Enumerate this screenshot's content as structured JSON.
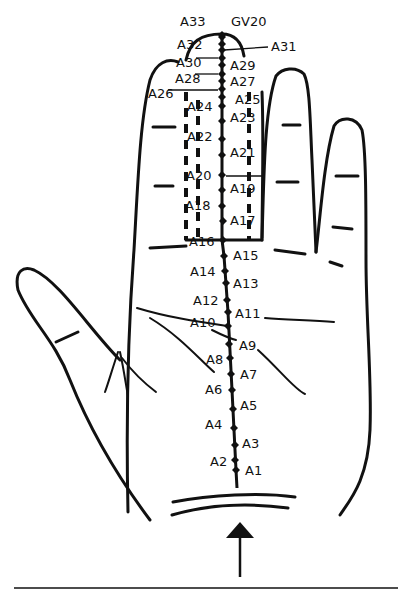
{
  "figure": {
    "arrow_direction": "up",
    "points": [
      {
        "id": "A1",
        "label": "A1",
        "x": 236,
        "y": 470,
        "side": "right"
      },
      {
        "id": "A2",
        "label": "A2",
        "x": 235,
        "y": 460,
        "side": "left"
      },
      {
        "id": "A3",
        "label": "A3",
        "x": 235,
        "y": 445,
        "side": "right"
      },
      {
        "id": "A4",
        "label": "A4",
        "x": 234,
        "y": 428,
        "side": "left"
      },
      {
        "id": "A5",
        "label": "A5",
        "x": 233,
        "y": 409,
        "side": "right"
      },
      {
        "id": "A6",
        "label": "A6",
        "x": 232,
        "y": 390,
        "side": "left"
      },
      {
        "id": "A7",
        "label": "A7",
        "x": 231,
        "y": 374,
        "side": "right"
      },
      {
        "id": "A8",
        "label": "A8",
        "x": 230,
        "y": 358,
        "side": "left"
      },
      {
        "id": "A9",
        "label": "A9",
        "x": 229,
        "y": 344,
        "side": "right"
      },
      {
        "id": "A10",
        "label": "A10",
        "x": 228,
        "y": 326,
        "side": "left"
      },
      {
        "id": "A11",
        "label": "A11",
        "x": 228,
        "y": 312,
        "side": "right"
      },
      {
        "id": "A12",
        "label": "A12",
        "x": 227,
        "y": 300,
        "side": "left"
      },
      {
        "id": "A13",
        "label": "A13",
        "x": 226,
        "y": 283,
        "side": "right"
      },
      {
        "id": "A14",
        "label": "A14",
        "x": 225,
        "y": 271,
        "side": "left"
      },
      {
        "id": "A15",
        "label": "A15",
        "x": 224,
        "y": 256,
        "side": "right"
      },
      {
        "id": "A16",
        "label": "A16",
        "x": 223,
        "y": 240,
        "side": "left"
      },
      {
        "id": "A17",
        "label": "A17",
        "x": 223,
        "y": 221,
        "side": "right"
      },
      {
        "id": "A18",
        "label": "A18",
        "x": 222,
        "y": 206,
        "side": "left"
      },
      {
        "id": "A19",
        "label": "A19",
        "x": 222,
        "y": 190,
        "side": "right"
      },
      {
        "id": "A20",
        "label": "A20",
        "x": 222,
        "y": 175,
        "side": "left"
      },
      {
        "id": "A21",
        "label": "A21",
        "x": 222,
        "y": 155,
        "side": "right"
      },
      {
        "id": "A22",
        "label": "A22",
        "x": 222,
        "y": 139,
        "side": "left"
      },
      {
        "id": "A23",
        "label": "A23",
        "x": 222,
        "y": 121,
        "side": "right"
      },
      {
        "id": "A24",
        "label": "A24",
        "x": 222,
        "y": 106,
        "side": "left"
      },
      {
        "id": "A25",
        "label": "A25",
        "x": 222,
        "y": 97,
        "side": "right"
      },
      {
        "id": "A26",
        "label": "A26",
        "x": 222,
        "y": 89,
        "side": "left"
      },
      {
        "id": "A27",
        "label": "A27",
        "x": 222,
        "y": 81,
        "side": "right"
      },
      {
        "id": "A28",
        "label": "A28",
        "x": 222,
        "y": 74,
        "side": "left"
      },
      {
        "id": "A29",
        "label": "A29",
        "x": 222,
        "y": 65,
        "side": "right"
      },
      {
        "id": "A30",
        "label": "A30",
        "x": 222,
        "y": 58,
        "side": "left"
      },
      {
        "id": "A31",
        "label": "A31",
        "x": 222,
        "y": 50,
        "side": "right"
      },
      {
        "id": "A32",
        "label": "A32",
        "x": 222,
        "y": 44,
        "side": "left"
      },
      {
        "id": "A33",
        "label": "A33",
        "x": 222,
        "y": 37,
        "side": "top"
      },
      {
        "id": "GV20",
        "label": "GV20",
        "x": 222,
        "y": 35,
        "side": "top"
      }
    ],
    "labels": [
      {
        "text": "A33",
        "x": 180,
        "y": 26
      },
      {
        "text": "GV20",
        "x": 231,
        "y": 26
      },
      {
        "text": "A32",
        "x": 177,
        "y": 49
      },
      {
        "text": "A31",
        "x": 271,
        "y": 51
      },
      {
        "text": "A30",
        "x": 176,
        "y": 67
      },
      {
        "text": "A29",
        "x": 230,
        "y": 70
      },
      {
        "text": "A28",
        "x": 175,
        "y": 83
      },
      {
        "text": "A27",
        "x": 230,
        "y": 86
      },
      {
        "text": "A26",
        "x": 148,
        "y": 98
      },
      {
        "text": "A25",
        "x": 235,
        "y": 104
      },
      {
        "text": "A24",
        "x": 187,
        "y": 111
      },
      {
        "text": "A23",
        "x": 230,
        "y": 122
      },
      {
        "text": "A22",
        "x": 187,
        "y": 141
      },
      {
        "text": "A21",
        "x": 230,
        "y": 157
      },
      {
        "text": "A20",
        "x": 186,
        "y": 180
      },
      {
        "text": "A19",
        "x": 230,
        "y": 193
      },
      {
        "text": "A18",
        "x": 185,
        "y": 210
      },
      {
        "text": "A17",
        "x": 230,
        "y": 225
      },
      {
        "text": "A16",
        "x": 189,
        "y": 246
      },
      {
        "text": "A15",
        "x": 233,
        "y": 260
      },
      {
        "text": "A14",
        "x": 190,
        "y": 276
      },
      {
        "text": "A13",
        "x": 233,
        "y": 288
      },
      {
        "text": "A12",
        "x": 193,
        "y": 305
      },
      {
        "text": "A11",
        "x": 235,
        "y": 318
      },
      {
        "text": "A10",
        "x": 190,
        "y": 327
      },
      {
        "text": "A9",
        "x": 239,
        "y": 350
      },
      {
        "text": "A8",
        "x": 206,
        "y": 364
      },
      {
        "text": "A7",
        "x": 240,
        "y": 379
      },
      {
        "text": "A6",
        "x": 205,
        "y": 394
      },
      {
        "text": "A5",
        "x": 240,
        "y": 410
      },
      {
        "text": "A4",
        "x": 205,
        "y": 429
      },
      {
        "text": "A3",
        "x": 242,
        "y": 448
      },
      {
        "text": "A2",
        "x": 210,
        "y": 466
      },
      {
        "text": "A1",
        "x": 245,
        "y": 475
      }
    ],
    "colors": {
      "ink": "#111111",
      "background": "#ffffff"
    }
  }
}
